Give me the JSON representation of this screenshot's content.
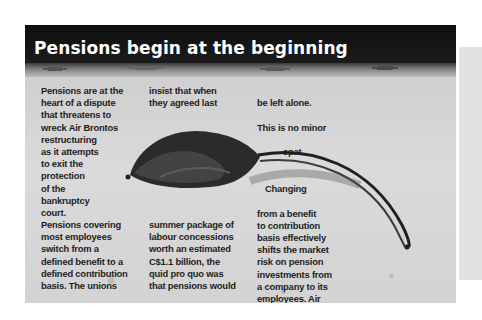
{
  "article": {
    "title": "Pensions begin at the beginning",
    "columns": {
      "col1_top": "Pensions are at the\nheart of a dispute\nthat threatens to\nwreck Air Brontos\nrestructuring\nas it attempts\nto exit the\nprotection\nof the\nbankruptcy\ncourt.",
      "col1_bottom": "Pensions covering\nmost employees\nswitch from a\ndefined benefit to a\ndefined contribution\nbasis. The unions",
      "col2_top": "insist that when\nthey agreed last",
      "col2_bottom": "summer package of\nlabour concessions\nworth an estimated\nC$1.1 billion, the\nquid pro quo was\nthat pensions would",
      "col3_top_line1": "be left alone.",
      "col3_top_line2": "This is no minor",
      "col3_top_line3": "spat.",
      "col3_bottom_first": "Changing",
      "col3_bottom_rest": "from a benefit\nto contribution\nbasis effectively\nshifts the market\nrisk on pension\ninvestments from\na company to its\nemployees. Air\nBronto's current"
    },
    "image": {
      "subject": "dried leaf with long curved stem on sand",
      "icon": "leaf-photo"
    }
  },
  "colors": {
    "header_band": "#111111",
    "sand": "#d6d6d6",
    "title_text": "#ffffff",
    "body_text": "#1e1e1e",
    "side_panel": "#e2e2e2"
  }
}
